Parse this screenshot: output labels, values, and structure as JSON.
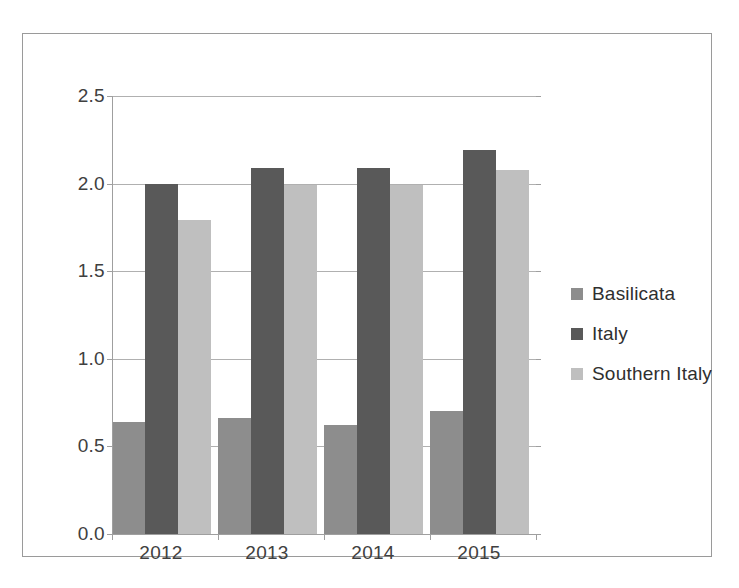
{
  "chart_data": {
    "type": "bar",
    "title": "",
    "subtitle": "",
    "xlabel": "",
    "ylabel": "",
    "categories": [
      "2012",
      "2013",
      "2014",
      "2015"
    ],
    "series": [
      {
        "name": "Basilicata",
        "color": "#8d8d8d",
        "values": [
          0.64,
          0.66,
          0.62,
          0.7
        ]
      },
      {
        "name": "Italy",
        "color": "#595959",
        "values": [
          2.0,
          2.09,
          2.09,
          2.19
        ]
      },
      {
        "name": "Southern Italy",
        "color": "#bfbfbf",
        "values": [
          1.79,
          1.99,
          1.99,
          2.08
        ]
      }
    ],
    "ylim": [
      0.0,
      2.5
    ],
    "ytick_values": [
      0.0,
      0.5,
      1.0,
      1.5,
      2.0,
      2.5
    ],
    "ytick_labels": [
      "0.0",
      "0.5",
      "1.0",
      "1.5",
      "2.0",
      "2.5"
    ],
    "grid": "horizontal",
    "legend_position": "right",
    "frame": "outer-border",
    "plot_background": "#ffffff"
  },
  "legend": {
    "entries": [
      {
        "label": "Basilicata",
        "swatch": "legend-swatch-basilicata"
      },
      {
        "label": "Italy",
        "swatch": "legend-swatch-italy"
      },
      {
        "label": "Southern Italy",
        "swatch": "legend-swatch-southern-italy"
      }
    ]
  }
}
